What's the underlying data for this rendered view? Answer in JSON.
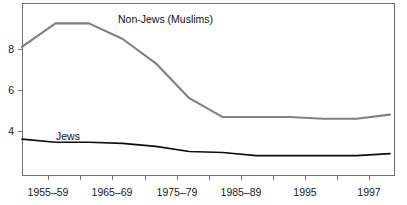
{
  "chart_data": {
    "type": "line",
    "title": "",
    "subtitle": "",
    "xlabel": "",
    "ylabel": "",
    "grid": false,
    "legend_position": "inline-annotation",
    "x": [
      "1955–59",
      "1960–64",
      "1965–69",
      "1970–74",
      "1975–79",
      "1980–84",
      "1985–89",
      "1990–94",
      "1995",
      "1996",
      "1997",
      "1998"
    ],
    "categories": [
      "1955–59",
      "1960–64",
      "1965–69",
      "1970–74",
      "1975–79",
      "1980–84",
      "1985–89",
      "1990–94",
      "1995",
      "1996",
      "1997",
      "1998"
    ],
    "x_tick_labels": [
      "1955–59",
      "1965–69",
      "1975–79",
      "1985–89",
      "1995",
      "1997"
    ],
    "x_tick_label_indices": [
      0,
      2,
      4,
      6,
      8,
      10
    ],
    "y_tick_labels": [
      "4",
      "6",
      "8"
    ],
    "y_ticks": [
      4,
      6,
      8
    ],
    "ylim": [
      2.3,
      9.7
    ],
    "xlim": [
      0,
      11
    ],
    "series": [
      {
        "name": "Non-Jews (Muslims)",
        "color": "#808080",
        "values": [
          8.1,
          9.25,
          9.25,
          8.5,
          7.3,
          5.6,
          4.68,
          4.68,
          4.68,
          4.6,
          4.6,
          4.8
        ]
      },
      {
        "name": "Jews",
        "color": "#0d0d0d",
        "values": [
          3.6,
          3.45,
          3.45,
          3.4,
          3.25,
          3.0,
          2.95,
          2.8,
          2.8,
          2.8,
          2.8,
          2.9
        ]
      }
    ],
    "annotations": [
      {
        "text": "Non-Jews (Muslims)",
        "series": "Non-Jews (Muslims)",
        "x_px": 118,
        "y_px": 23
      },
      {
        "text": "Jews",
        "series": "Jews",
        "x_px": 56,
        "y_px": 140
      }
    ]
  },
  "colors": {
    "nonjews_line": "#808080",
    "jews_line": "#0d0d0d",
    "axis": "#6f6f6f",
    "text": "#1a1a1a",
    "background": "#ffffff"
  },
  "icons": {}
}
